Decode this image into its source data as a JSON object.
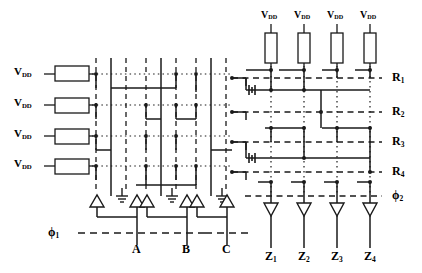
{
  "diagram": {
    "colors": {
      "ink": "#1a1a1a",
      "background": "#ffffff"
    }
  },
  "supply_labels_left": [
    {
      "text": "V",
      "sub": "DD"
    },
    {
      "text": "V",
      "sub": "DD"
    },
    {
      "text": "V",
      "sub": "DD"
    },
    {
      "text": "V",
      "sub": "DD"
    }
  ],
  "supply_labels_top": [
    {
      "text": "V",
      "sub": "DD"
    },
    {
      "text": "V",
      "sub": "DD"
    },
    {
      "text": "V",
      "sub": "DD"
    },
    {
      "text": "V",
      "sub": "DD"
    }
  ],
  "row_labels": [
    {
      "text": "R",
      "sub": "1"
    },
    {
      "text": "R",
      "sub": "2"
    },
    {
      "text": "R",
      "sub": "3"
    },
    {
      "text": "R",
      "sub": "4"
    }
  ],
  "input_labels": [
    {
      "text": "A",
      "sub": ""
    },
    {
      "text": "B",
      "sub": ""
    },
    {
      "text": "C",
      "sub": ""
    }
  ],
  "output_labels": [
    {
      "text": "Z",
      "sub": "1"
    },
    {
      "text": "Z",
      "sub": "2"
    },
    {
      "text": "Z",
      "sub": "3"
    },
    {
      "text": "Z",
      "sub": "4"
    }
  ],
  "clock_labels": [
    {
      "text": "ϕ",
      "sub": "1"
    },
    {
      "text": "ϕ",
      "sub": "2"
    }
  ],
  "icons": {
    "resistor": "resistor-box",
    "buffer": "triangle-buffer-icon",
    "ground": "ground-icon",
    "node": "connection-dot"
  }
}
